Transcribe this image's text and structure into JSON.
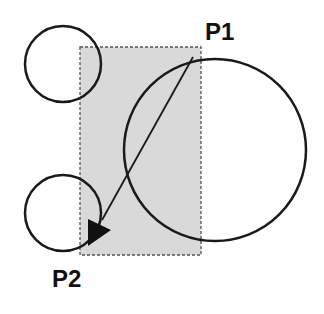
{
  "diagram": {
    "labels": {
      "start_point": "P1",
      "end_point": "P2"
    },
    "colors": {
      "selection_fill": "#d9d9d9",
      "stroke": "#1a1a1a",
      "background": "#ffffff"
    },
    "selection_rect": {
      "x1": 80,
      "y1": 47,
      "x2": 201,
      "y2": 255,
      "style": "dashed"
    },
    "circles": [
      {
        "id": "small-top",
        "cx": 63,
        "cy": 64,
        "r": 38
      },
      {
        "id": "small-bottom",
        "cx": 63,
        "cy": 213,
        "r": 38
      },
      {
        "id": "large",
        "cx": 215,
        "cy": 150,
        "r": 91
      }
    ],
    "arrow": {
      "from": [
        193,
        57
      ],
      "to": [
        92,
        236
      ]
    }
  }
}
